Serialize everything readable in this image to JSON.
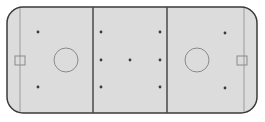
{
  "diagram": {
    "type": "hockey-rink",
    "colors": {
      "ice": "#dcdcdc",
      "boards": "#3a3a3a",
      "lines": "#4a4a4a",
      "circles": "#8a8a8a",
      "dots": "#3a3a3a",
      "background": "#ffffff"
    },
    "rink": {
      "x": 7,
      "y": 7,
      "width": 250,
      "height": 106,
      "corner_radius": 16
    },
    "goal_lines": [
      20,
      244
    ],
    "blue_lines": [
      93,
      167
    ],
    "faceoff_circles": [
      {
        "cx": 66,
        "cy": 60,
        "r": 12
      },
      {
        "cx": 197,
        "cy": 60,
        "r": 12
      }
    ],
    "faceoff_dots": [
      {
        "cx": 38,
        "cy": 32
      },
      {
        "cx": 38,
        "cy": 87
      },
      {
        "cx": 101,
        "cy": 32
      },
      {
        "cx": 101,
        "cy": 60
      },
      {
        "cx": 101,
        "cy": 87
      },
      {
        "cx": 130,
        "cy": 60
      },
      {
        "cx": 160,
        "cy": 32
      },
      {
        "cx": 160,
        "cy": 60
      },
      {
        "cx": 160,
        "cy": 87
      },
      {
        "cx": 225,
        "cy": 33
      },
      {
        "cx": 225,
        "cy": 88
      }
    ],
    "goals": [
      {
        "x": 15,
        "y": 56,
        "width": 10,
        "height": 9
      },
      {
        "x": 237,
        "y": 56,
        "width": 10,
        "height": 9
      }
    ]
  }
}
